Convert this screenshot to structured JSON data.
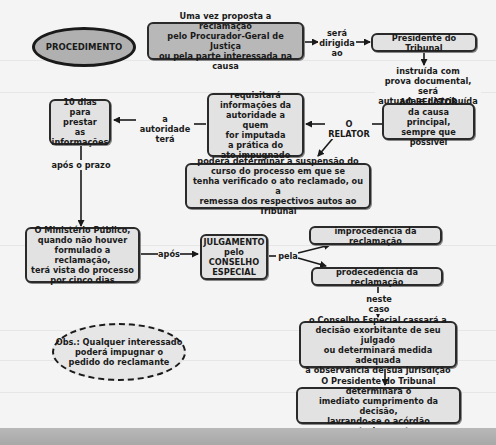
{
  "diagram": {
    "title_node": "PROCEDIMENTO",
    "nodes": {
      "proposta": "Uma vez proposta a reclamação\npelo Procurador-Geral de Justiça\nou pela parte interessada na causa",
      "presidente": "Presidente do Tribunal",
      "ao_relator_title": "AO RELATOR",
      "ao_relator_body": "da causa principal,\nsempre que possível",
      "requisitara": "requisitará\ninformações da\nautoridade a quem\nfor imputada\na prática do\nato impugnado",
      "dez_dias": "10 dias\npara prestar\nas\ninformações",
      "suspensao": "poderá determinar a suspensão do\ncurso do processo em que se\ntenha verificado o ato reclamado, ou a\nremessa dos respectivos autos ao Tribunal",
      "ministerio": "O Ministério Público,\nquando não houver\nformulado a reclamação,\nterá vista do processo\npor cinco dias",
      "julgamento": "JULGAMENTO\npelo\nCONSELHO\nESPECIAL",
      "improcedencia": "improcedência da reclamação",
      "procedencia": "prodecedência da reclamação",
      "conselho": "o Conselho Especial cassará a\ndecisão exorbitante de seu julgado\nou determinará medida adequada\nà observância de sua jurisdição",
      "presidente_final": "O Presidente do Tribunal determinará o\nimediato cumprimento da decisão,\nlavrando-se o acórdão posteriormente",
      "obs": "Obs.: Qualquer interessado\npoderá impugnar o\npedido do reclamante"
    },
    "edge_labels": {
      "sera_dirigida": "será\ndirigida\nao",
      "instruida": "instruída com\nprova documental, será\nautuada e distribuída",
      "o_relator": "O RELATOR",
      "autoridade_tera": "a autoridade\nterá",
      "apos_prazo": "após o prazo",
      "apos": "após",
      "pela": "pela",
      "neste_caso": "neste caso"
    },
    "colors": {
      "background": "#f4f4f4",
      "node_fill": "#e2e2e2",
      "node_dark_fill": "#b8b8b8",
      "stroke": "#1a1a1a"
    }
  }
}
